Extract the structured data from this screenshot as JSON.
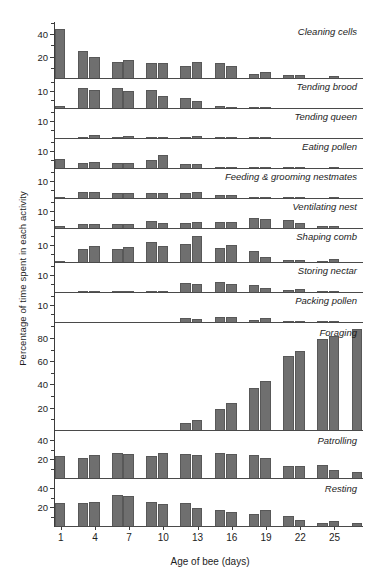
{
  "chart_data": {
    "type": "bar",
    "title": "",
    "xlabel": "Age of bee (days)",
    "ylabel": "Percentage of time spent in each activity",
    "grid": false,
    "legend_position": "inline-right",
    "x": [
      1,
      2,
      3,
      4,
      5,
      6,
      7,
      8,
      9,
      10,
      11,
      12,
      13,
      14,
      15,
      16,
      17,
      18,
      19,
      20,
      21,
      22,
      23,
      24,
      25,
      26,
      27
    ],
    "x_tick_labels": [
      "1",
      "4",
      "7",
      "10",
      "13",
      "16",
      "19",
      "22",
      "25"
    ],
    "x_tick_values": [
      1,
      4,
      7,
      10,
      13,
      16,
      19,
      22,
      25
    ],
    "note": "Bars are grouped in pairs across 27 day-bins; each panel is an independent activity with its own y-scale.",
    "panels": [
      {
        "name": "Cleaning cells",
        "ymax": 50,
        "yticks": [
          20,
          40
        ],
        "ytick_labels": [
          "20",
          "40"
        ],
        "minor_ticks": [
          10,
          30,
          50
        ],
        "values": [
          44,
          0,
          24,
          19,
          0,
          14,
          16,
          0,
          13,
          13,
          0,
          11,
          14,
          0,
          13,
          11,
          0,
          4,
          5,
          0,
          3,
          3,
          0,
          0,
          2,
          0,
          0
        ]
      },
      {
        "name": "Tending brood",
        "ymax": 16,
        "yticks": [
          10
        ],
        "ytick_labels": [
          "10"
        ],
        "minor_ticks": [
          5,
          15
        ],
        "values": [
          1,
          0,
          11,
          10,
          0,
          11,
          9.5,
          0,
          10,
          6.5,
          0,
          5.5,
          4,
          0,
          1,
          0.5,
          0,
          0.5,
          0.3,
          0,
          0,
          0,
          0,
          0,
          0,
          0,
          0
        ]
      },
      {
        "name": "Tending queen",
        "ymax": 16,
        "yticks": [
          10
        ],
        "ytick_labels": [
          "10"
        ],
        "minor_ticks": [
          5,
          15
        ],
        "values": [
          0,
          0,
          0.4,
          1.4,
          0,
          0.6,
          1.3,
          0,
          0.4,
          0.6,
          0,
          0.5,
          1.2,
          0,
          0.3,
          0.2,
          0,
          0.1,
          0.1,
          0,
          0,
          0,
          0,
          0,
          0,
          0,
          0
        ]
      },
      {
        "name": "Eating pollen",
        "ymax": 16,
        "yticks": [
          10
        ],
        "ytick_labels": [
          "10"
        ],
        "minor_ticks": [
          5,
          15
        ],
        "values": [
          5,
          0,
          3,
          3.5,
          0,
          3,
          2.5,
          0,
          4.5,
          7,
          0,
          2,
          2,
          0,
          0.4,
          0.3,
          0,
          0.3,
          0.2,
          0,
          0.2,
          0.2,
          0,
          0,
          0.2,
          0,
          0
        ]
      },
      {
        "name": "Feeding & grooming nestmates",
        "ymax": 16,
        "yticks": [
          10
        ],
        "ytick_labels": [
          "10"
        ],
        "minor_ticks": [
          5,
          15
        ],
        "values": [
          0.3,
          0,
          3.5,
          3.5,
          0,
          3,
          2.5,
          0,
          3,
          3,
          0,
          2.5,
          3.5,
          0,
          1.5,
          1.5,
          0,
          0.8,
          0.8,
          0,
          0.3,
          0.3,
          0,
          0,
          0.2,
          0,
          0
        ]
      },
      {
        "name": "Ventilating nest",
        "ymax": 16,
        "yticks": [
          10
        ],
        "ytick_labels": [
          "10"
        ],
        "minor_ticks": [
          5,
          15
        ],
        "values": [
          1,
          0,
          2,
          2,
          0,
          2,
          2,
          0,
          4,
          3,
          0,
          3,
          3.5,
          0,
          3.5,
          3.5,
          0,
          5.5,
          5,
          0,
          4.5,
          2.5,
          0,
          1.2,
          1.2,
          0,
          0
        ]
      },
      {
        "name": "Shaping comb",
        "ymax": 18,
        "yticks": [
          10
        ],
        "ytick_labels": [
          "10"
        ],
        "minor_ticks": [
          5,
          15
        ],
        "values": [
          0.3,
          0,
          7,
          9,
          0,
          7,
          8,
          0,
          11,
          8.5,
          0,
          10,
          14,
          0,
          7.5,
          9.5,
          0,
          6,
          2.5,
          0,
          1.2,
          1,
          0,
          0.8,
          1.5,
          0,
          0
        ]
      },
      {
        "name": "Storing nectar",
        "ymax": 16,
        "yticks": [
          10
        ],
        "ytick_labels": [
          "10"
        ],
        "minor_ticks": [
          5,
          15
        ],
        "values": [
          0,
          0,
          0.4,
          0.3,
          0,
          0.2,
          0.2,
          0,
          0.8,
          0.5,
          0,
          5,
          4.5,
          0,
          5.5,
          4.5,
          0,
          4,
          2,
          0,
          1,
          1.5,
          0,
          0.3,
          0.3,
          0,
          0
        ]
      },
      {
        "name": "Packing pollen",
        "ymax": 16,
        "yticks": [
          10
        ],
        "ytick_labels": [
          "10"
        ],
        "minor_ticks": [
          5,
          15
        ],
        "values": [
          0,
          0,
          0,
          0,
          0,
          0,
          0,
          0,
          0,
          0,
          0,
          2,
          1.5,
          0,
          2.5,
          2.5,
          0,
          1.2,
          2.2,
          0,
          0.4,
          0.4,
          0,
          0.2,
          0.2,
          0,
          0
        ]
      },
      {
        "name": "Foraging",
        "ymax": 92,
        "yticks": [
          20,
          40,
          60,
          80
        ],
        "ytick_labels": [
          "20",
          "40",
          "60",
          "80"
        ],
        "minor_ticks": [
          10,
          30,
          50,
          70,
          90
        ],
        "values": [
          0,
          0,
          0,
          0,
          0,
          0,
          0,
          0,
          0,
          0,
          0,
          6,
          9,
          0,
          18,
          23,
          0,
          36,
          42,
          0,
          64,
          68,
          0,
          78,
          81,
          0,
          87
        ]
      },
      {
        "name": "Patrolling",
        "ymax": 48,
        "yticks": [
          20,
          40
        ],
        "ytick_labels": [
          "20",
          "40"
        ],
        "minor_ticks": [
          10,
          30
        ],
        "values": [
          22,
          0,
          20,
          23,
          0,
          26,
          25,
          0,
          22,
          26,
          0,
          25,
          24,
          0,
          26,
          25,
          0,
          23,
          20,
          0,
          12,
          12,
          0,
          13,
          8,
          0,
          6
        ]
      },
      {
        "name": "Resting",
        "ymax": 48,
        "yticks": [
          20,
          40
        ],
        "ytick_labels": [
          "20",
          "40"
        ],
        "minor_ticks": [
          10,
          30
        ],
        "values": [
          23,
          0,
          24,
          25,
          0,
          32,
          31,
          0,
          25,
          22,
          0,
          23,
          18,
          0,
          16,
          14,
          0,
          12,
          16,
          0,
          10,
          6,
          0,
          3,
          5,
          0,
          3
        ]
      }
    ]
  },
  "style": {
    "bar_color": "#6f6f6f",
    "axis_color": "#3c3c3c",
    "text_color": "#1d1d1d"
  }
}
